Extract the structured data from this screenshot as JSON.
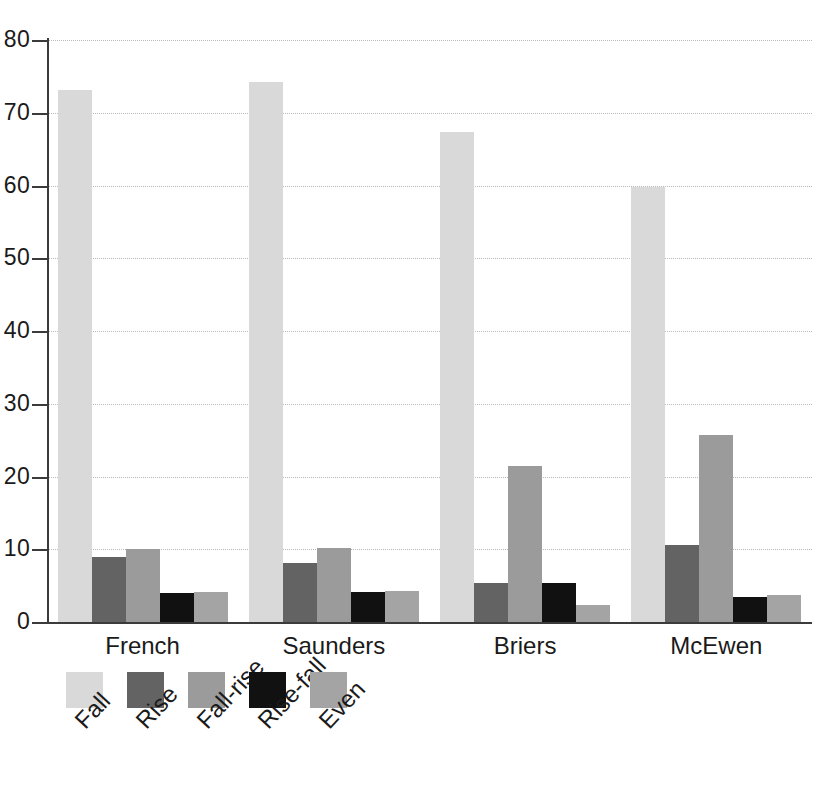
{
  "chart_data": {
    "type": "bar",
    "title": "",
    "subtitle": "",
    "xlabel": "",
    "ylabel": "",
    "ylim": [
      0,
      80
    ],
    "yticks": [
      0,
      10,
      20,
      30,
      40,
      50,
      60,
      70,
      80
    ],
    "grid": true,
    "grid_style": "dotted horizontal",
    "legend_position": "bottom-left",
    "legend_label_rotation": -47,
    "categories": [
      "French",
      "Saunders",
      "Briers",
      "McEwen"
    ],
    "series": [
      {
        "name": "Fall",
        "color": "#d9d9d9",
        "values": [
          73.1,
          74.2,
          67.4,
          59.8
        ]
      },
      {
        "name": "Rise",
        "color": "#636363",
        "values": [
          8.9,
          8.1,
          5.3,
          10.6
        ]
      },
      {
        "name": "Fall-rise",
        "color": "#9b9b9b",
        "values": [
          10.0,
          10.2,
          21.4,
          25.7
        ]
      },
      {
        "name": "Rise-fall",
        "color": "#111111",
        "values": [
          4.0,
          4.1,
          5.4,
          3.5
        ]
      },
      {
        "name": "Even",
        "color": "#a4a4a4",
        "values": [
          4.1,
          4.2,
          2.3,
          3.7
        ]
      }
    ],
    "axis_color": "#3b3b3b",
    "gridline_color": "#b9b9b9",
    "background_color": "#ffffff"
  }
}
